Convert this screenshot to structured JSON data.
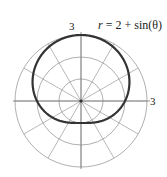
{
  "chart_data": {
    "type": "line",
    "subtype": "polar",
    "title": "",
    "equation": "r = 2 + sin(θ)",
    "equation_parts": {
      "lhs": "r",
      "rhs": "2 + sin(θ)"
    },
    "radial_ticks": [
      1,
      2,
      3
    ],
    "radial_max": 3,
    "angle_spokes_deg": [
      0,
      30,
      60,
      90,
      120,
      150,
      180,
      210,
      240,
      270,
      300,
      330
    ],
    "axis_labels": {
      "top": "3",
      "right": "3"
    },
    "series": [
      {
        "name": "r = 2 + sin(θ)",
        "function": "2 + sin(theta)",
        "theta_range": [
          0,
          6.2832
        ],
        "sample_points": [
          {
            "theta_deg": 0,
            "r": 2
          },
          {
            "theta_deg": 90,
            "r": 3
          },
          {
            "theta_deg": 180,
            "r": 2
          },
          {
            "theta_deg": 270,
            "r": 1
          }
        ],
        "color": "#333333"
      }
    ],
    "grid": true,
    "colors": {
      "grid": "#9a9a9a",
      "curve": "#333333"
    }
  }
}
